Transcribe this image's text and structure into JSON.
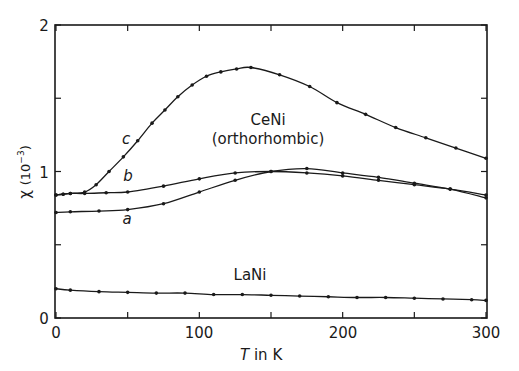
{
  "chart_data": {
    "type": "line",
    "title": "",
    "xlabel": "T in K",
    "ylabel": "χ (10⁻³)",
    "xlim": [
      0,
      300
    ],
    "ylim": [
      0,
      2
    ],
    "x_ticks": [
      0,
      100,
      200,
      300
    ],
    "y_ticks": [
      0,
      1,
      2
    ],
    "grid": false,
    "legend": "none (curves labelled inline)",
    "annotations": [
      "CeNi",
      "(orthorhombic)",
      "LaNi",
      "a",
      "b",
      "c"
    ],
    "series": [
      {
        "name": "c",
        "compound": "CeNi",
        "x": [
          0,
          5,
          10,
          20,
          28,
          37,
          47,
          57,
          67,
          76,
          85,
          95,
          105,
          115,
          126,
          136,
          156,
          177,
          196,
          216,
          237,
          258,
          279,
          300
        ],
        "y": [
          0.84,
          0.845,
          0.85,
          0.86,
          0.91,
          1.0,
          1.1,
          1.21,
          1.33,
          1.42,
          1.51,
          1.59,
          1.65,
          1.68,
          1.7,
          1.71,
          1.66,
          1.58,
          1.47,
          1.39,
          1.3,
          1.23,
          1.16,
          1.09
        ]
      },
      {
        "name": "b",
        "compound": "CeNi",
        "x": [
          0,
          5,
          10,
          20,
          35,
          50,
          75,
          100,
          125,
          150,
          175,
          200,
          225,
          250,
          275,
          300
        ],
        "y": [
          0.84,
          0.845,
          0.85,
          0.85,
          0.855,
          0.86,
          0.9,
          0.95,
          0.99,
          1.0,
          0.99,
          0.97,
          0.94,
          0.91,
          0.88,
          0.84
        ]
      },
      {
        "name": "a",
        "compound": "CeNi",
        "x": [
          0,
          10,
          30,
          50,
          75,
          100,
          125,
          150,
          175,
          200,
          225,
          250,
          275,
          300
        ],
        "y": [
          0.72,
          0.725,
          0.73,
          0.74,
          0.78,
          0.86,
          0.94,
          1.0,
          1.02,
          0.99,
          0.96,
          0.92,
          0.88,
          0.82
        ]
      },
      {
        "name": "LaNi",
        "compound": "LaNi",
        "x": [
          0,
          10,
          30,
          50,
          70,
          90,
          110,
          130,
          150,
          170,
          190,
          210,
          230,
          250,
          270,
          290,
          300
        ],
        "y": [
          0.2,
          0.19,
          0.18,
          0.175,
          0.17,
          0.17,
          0.16,
          0.16,
          0.155,
          0.15,
          0.145,
          0.14,
          0.14,
          0.135,
          0.13,
          0.125,
          0.12
        ]
      }
    ]
  },
  "labels": {
    "xlabel_T": "T",
    "xlabel_rest": " in K",
    "ylabel_chi": "χ",
    "ylabel_unit": "(10",
    "ylabel_exp": "−3",
    "ylabel_close": ")",
    "cеni": "CeNi",
    "ceni": "CeNi",
    "ortho": "(orthorhombic)",
    "lani": "LaNi",
    "a": "a",
    "b": "b",
    "c": "c",
    "x0": "0",
    "x100": "100",
    "x200": "200",
    "x300": "300",
    "y0": "0",
    "y1": "1",
    "y2": "2"
  }
}
